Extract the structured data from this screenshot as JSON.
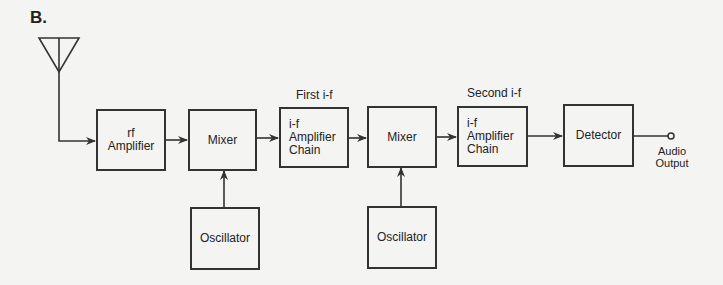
{
  "figure": {
    "label": "B.",
    "type": "superheterodyne receiver block diagram (double conversion)"
  },
  "blocks": {
    "rf_amplifier": {
      "line1": "rf",
      "line2": "Amplifier"
    },
    "mixer1": {
      "line1": "Mixer"
    },
    "if_amp1": {
      "line1": "i-f Amplifier",
      "line2": "Chain"
    },
    "mixer2": {
      "line1": "Mixer"
    },
    "if_amp2": {
      "line1": "i-f Amplifier",
      "line2": "Chain"
    },
    "detector": {
      "line1": "Detector"
    },
    "oscillator1": {
      "line1": "Oscillator"
    },
    "oscillator2": {
      "line1": "Oscillator"
    }
  },
  "captions": {
    "first_if": "First i-f",
    "second_if": "Second i-f"
  },
  "output": {
    "line1": "Audio",
    "line2": "Output"
  },
  "icons": {
    "antenna": "antenna-icon",
    "output_terminal": "terminal-circle-icon"
  },
  "colors": {
    "line": "#333333",
    "background": "#f4f4f2"
  }
}
